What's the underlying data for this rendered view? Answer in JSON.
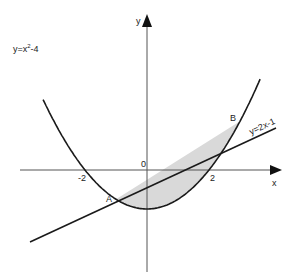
{
  "diagram": {
    "axes": {
      "x_label": "x",
      "y_label": "y",
      "origin_label": "0"
    },
    "ticks": [
      {
        "label": "-2",
        "x": -2
      },
      {
        "label": "2",
        "x": 2
      }
    ],
    "curves": [
      {
        "name": "parabola",
        "label": "y=x²-4",
        "label_base": "y=x",
        "label_sup": "2",
        "label_tail": "-4"
      },
      {
        "name": "line",
        "label": "y=2x-1"
      }
    ],
    "points": [
      {
        "label": "A",
        "x": -1,
        "y": -3
      },
      {
        "label": "B",
        "x": 3,
        "y": 5
      }
    ],
    "shaded_region": "between y=2x-1 and y=x²-4 from A to B",
    "colors": {
      "stroke": "#1a1a1a",
      "axis": "#444444",
      "shade": "#d9d9d9"
    }
  }
}
